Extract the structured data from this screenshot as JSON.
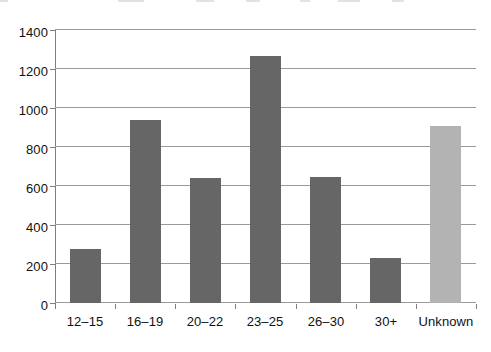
{
  "chart_data": {
    "type": "bar",
    "title": "",
    "subtitle": "",
    "xlabel": "",
    "ylabel": "",
    "categories": [
      "12–15",
      "16–19",
      "20–22",
      "23–25",
      "26–30",
      "30+",
      "Unknown"
    ],
    "values": [
      275,
      940,
      640,
      1265,
      648,
      230,
      910
    ],
    "ylim": [
      0,
      1400
    ],
    "y_ticks": [
      0,
      200,
      400,
      600,
      800,
      1000,
      1200,
      1400
    ],
    "y_tick_labels": [
      "0",
      "200",
      "400",
      "600",
      "800",
      "1000",
      "1200",
      "1400"
    ],
    "grid": true,
    "legend": "none",
    "bar_colors": [
      "#666666",
      "#666666",
      "#666666",
      "#666666",
      "#666666",
      "#666666",
      "#b3b3b3"
    ],
    "series": [
      {
        "name": "count",
        "values": [
          275,
          940,
          640,
          1265,
          648,
          230,
          910
        ]
      }
    ]
  },
  "colors": {
    "bar_dark": "#666666",
    "bar_light": "#b3b3b3",
    "gridline": "#9a9a9a",
    "axis": "#7f7f7f",
    "text": "#111111",
    "background": "#ffffff"
  }
}
